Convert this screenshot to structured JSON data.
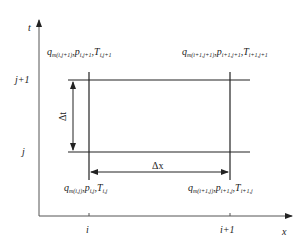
{
  "diagram": {
    "axes": {
      "x_label": "x",
      "y_label": "t"
    },
    "x_ticks": [
      "i",
      "i+1"
    ],
    "y_ticks": [
      "j+1",
      "j"
    ],
    "intervals": {
      "dt": "Δt",
      "dx": "Δx"
    },
    "nodes": {
      "top_left": {
        "q": "q",
        "q_sub": "m(i,j+1)",
        "p": "p",
        "p_sub": "i,j+1",
        "T": "T",
        "T_sub": "i,j+1"
      },
      "top_right": {
        "q": "q",
        "q_sub": "m(i+1,j+1)",
        "p": "p",
        "p_sub": "i+1,j+1",
        "T": "T",
        "T_sub": "i+1,j+1"
      },
      "bottom_left": {
        "q": "q",
        "q_sub": "m(i,j)",
        "p": "p",
        "p_sub": "i,j",
        "T": "T",
        "T_sub": "i,j"
      },
      "bottom_right": {
        "q": "q",
        "q_sub": "m(i+1,j)",
        "p": "p",
        "p_sub": "i+1,j",
        "T": "T",
        "T_sub": "i+1,j"
      }
    },
    "line_color": "#222222"
  }
}
